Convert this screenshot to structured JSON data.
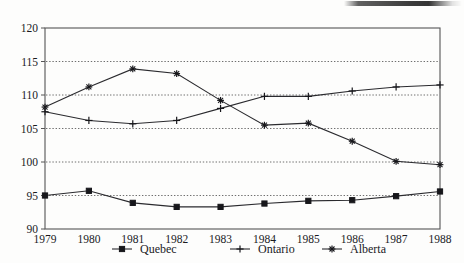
{
  "chart_data": {
    "type": "line",
    "title": "",
    "subtitle": "",
    "xlabel": "",
    "ylabel": "",
    "x": [
      1979,
      1980,
      1981,
      1982,
      1983,
      1984,
      1985,
      1986,
      1987,
      1988
    ],
    "categories": [
      "1979",
      "1980",
      "1981",
      "1982",
      "1983",
      "1984",
      "1985",
      "1986",
      "1987",
      "1988"
    ],
    "xlim": [
      1979,
      1988
    ],
    "ylim": [
      90,
      120
    ],
    "yticks": [
      90,
      95,
      100,
      105,
      110,
      115,
      120
    ],
    "ytick_labels": [
      "90",
      "95",
      "100",
      "105",
      "110",
      "115",
      "120"
    ],
    "grid": "horizontal-dotted",
    "legend_position": "bottom",
    "series": [
      {
        "name": "Quebec",
        "marker": "square",
        "values": [
          95.0,
          95.7,
          93.9,
          93.3,
          93.3,
          93.8,
          94.2,
          94.3,
          94.9,
          95.6
        ]
      },
      {
        "name": "Ontario",
        "marker": "plus",
        "values": [
          107.5,
          106.2,
          105.7,
          106.2,
          108.0,
          109.8,
          109.8,
          110.6,
          111.2,
          111.5
        ]
      },
      {
        "name": "Alberta",
        "marker": "asterisk",
        "values": [
          108.2,
          111.2,
          113.9,
          113.2,
          109.2,
          105.5,
          105.8,
          103.1,
          100.1,
          99.6
        ]
      }
    ]
  },
  "legend": {
    "entries": [
      {
        "label": "Quebec",
        "marker": "square-marker-icon"
      },
      {
        "label": "Ontario",
        "marker": "plus-marker-icon"
      },
      {
        "label": "Alberta",
        "marker": "asterisk-marker-icon"
      }
    ]
  },
  "colors": {
    "line": "#2a2a2e",
    "marker": "#17171b",
    "grid": "#4a4a4a",
    "frame": "#555555",
    "text": "#1a1a1e",
    "background": "#fdfdfc"
  }
}
